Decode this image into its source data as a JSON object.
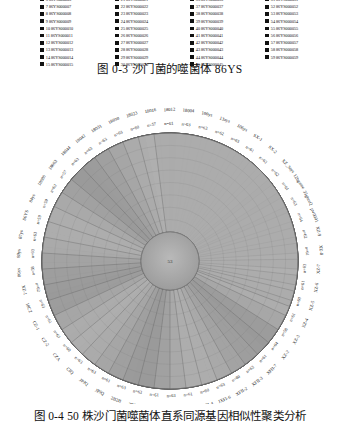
{
  "legend": {
    "swatch_color": "#111111",
    "items": [
      {
        "index": "6",
        "label": "6 86YS000006"
      },
      {
        "index": "7",
        "label": "7 86YS000007"
      },
      {
        "index": "8",
        "label": "8 86YS000008"
      },
      {
        "index": "9",
        "label": "9 86YS000009"
      },
      {
        "index": "10",
        "label": "10 86YS000010"
      },
      {
        "index": "11",
        "label": "11 86YS000011"
      },
      {
        "index": "12",
        "label": "12 86YS000012"
      },
      {
        "index": "13",
        "label": "13 86YS000013"
      },
      {
        "index": "14",
        "label": "14 86YS000014"
      },
      {
        "index": "15",
        "label": "15 86YS000015"
      },
      {
        "index": "21",
        "label": "21 86YS000021"
      },
      {
        "index": "22",
        "label": "22 86YS000022"
      },
      {
        "index": "23",
        "label": "23 86YS000023"
      },
      {
        "index": "24",
        "label": "24 86YS000024"
      },
      {
        "index": "25",
        "label": "25 86YS000025"
      },
      {
        "index": "26",
        "label": "26 86YS000026"
      },
      {
        "index": "27",
        "label": "27 86YS000027"
      },
      {
        "index": "28",
        "label": "28 86YS000028"
      },
      {
        "index": "29",
        "label": "29 86YS000029"
      },
      {
        "index": "30",
        "label": "30 86YS000030"
      },
      {
        "index": "36",
        "label": "36 86YS000036"
      },
      {
        "index": "37",
        "label": "37 86YS000037"
      },
      {
        "index": "38",
        "label": "38 86YS000038"
      },
      {
        "index": "39",
        "label": "39 86YS000039"
      },
      {
        "index": "40",
        "label": "40 86YS000040"
      },
      {
        "index": "41",
        "label": "41 86YS000041"
      },
      {
        "index": "42",
        "label": "42 86YS000042"
      },
      {
        "index": "43",
        "label": "43 86YS000043"
      },
      {
        "index": "44",
        "label": "44 86YS000044"
      },
      {
        "index": "45",
        "label": "45 86YS000045"
      },
      {
        "index": "51",
        "label": "51 86YS000051"
      },
      {
        "index": "52",
        "label": "52 86YS000052"
      },
      {
        "index": "53",
        "label": "53 86YS000053"
      },
      {
        "index": "54",
        "label": "54 86YS000054"
      },
      {
        "index": "55",
        "label": "55 86YS000055"
      },
      {
        "index": "56",
        "label": "56 86YS000056"
      },
      {
        "index": "57",
        "label": "57 86YS000057"
      },
      {
        "index": "58",
        "label": "58 86YS000058"
      },
      {
        "index": "59",
        "label": "59 86YS000059"
      }
    ]
  },
  "captions": {
    "top": "图 0-3  沙门菌的噬菌体 86YS",
    "bottom": "图 0-4  50 株沙门菌噬菌体直系同源基因相似性聚类分析"
  },
  "figure": {
    "hub_label": "53",
    "strain_labels": [
      "86ys",
      "89ys",
      "87ys",
      "86YS",
      "84ys",
      "18080",
      "18063",
      "18044",
      "18042",
      "18031",
      "18030",
      "18023",
      "18016",
      "18012",
      "18004",
      "100ys",
      "13ays",
      "106ys",
      "SX-1",
      "SX-2",
      "XZ_3ays",
      "12bgame",
      "35gtuxQ",
      "pw0001",
      "XZ-9",
      "XZ-8",
      "XZ-7",
      "XZ-6",
      "XZ-5",
      "XZ-4",
      "XZ-3",
      "XZ-2",
      "XFII-7",
      "XFII-3",
      "XFII-2",
      "JXFI-6",
      "JXFI-4",
      "10XF2",
      "10XF1",
      "-0(x)",
      "2B2B",
      "2B2B",
      "JPJQ",
      "JPJQ",
      "CIQ",
      "CZA",
      "CZ-2",
      "CZ-1",
      "18CZ",
      "XZ-1"
    ],
    "n_labels": [
      "n=58",
      "n=63",
      "n=63",
      "n=59",
      "n=59",
      "n=62",
      "n=57",
      "n=63",
      "n=63",
      "n=63",
      "n=63",
      "n=60",
      "n=57",
      "n=61",
      "n=63",
      "n=63",
      "n=62",
      "n=63",
      "n=61",
      "n=62",
      "n=62",
      "n=61",
      "n=63",
      "n=64",
      "n=62",
      "n=61",
      "n=63",
      "n=61",
      "n=60",
      "n=61",
      "n=58",
      "n=64",
      "n=61",
      "n=63",
      "n=60",
      "n=63",
      "n=60",
      "n=61",
      "n=63",
      "n=61",
      "n=63",
      "n=63",
      "n=61",
      "n=63",
      "n=63",
      "n=60",
      "n=63",
      "n=61",
      "n=63",
      "n=62"
    ]
  }
}
